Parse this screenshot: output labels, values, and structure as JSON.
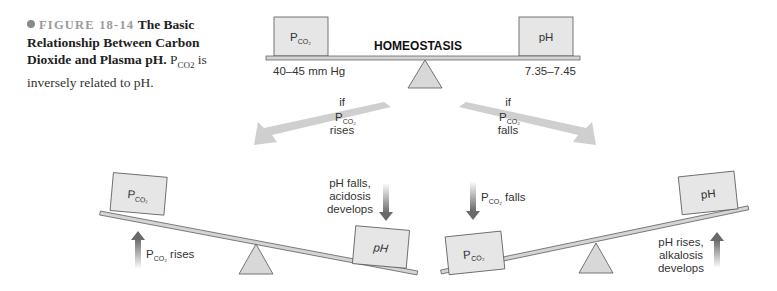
{
  "caption": {
    "figure_label": "FIGURE 18-14",
    "title": "The Basic Relationship Between Carbon Dioxide and Plasma pH.",
    "body_prefix": "P",
    "body_sub": "CO2",
    "body_suffix": " is inversely related to pH."
  },
  "top_scale": {
    "label": "HOMEOSTASIS",
    "left_box": {
      "main": "P",
      "sub": "CO₂"
    },
    "right_box": {
      "main": "pH"
    },
    "left_range": "40–45 mm Hg",
    "right_range": "7.35–7.45"
  },
  "branches": {
    "left": {
      "line1": "if",
      "line2_main": "P",
      "line2_sub": "CO₂",
      "line3": "rises"
    },
    "right": {
      "line1": "if",
      "line2_main": "P",
      "line2_sub": "CO₂",
      "line3": "falls"
    }
  },
  "acidosis_scale": {
    "left_box": {
      "main": "P",
      "sub": "CO₂"
    },
    "right_box": {
      "main": "pH"
    },
    "up_label_main": "P",
    "up_label_sub": "CO₂",
    "up_label_suffix": " rises",
    "down_label": [
      "pH falls,",
      "acidosis",
      "develops"
    ]
  },
  "alkalosis_scale": {
    "left_box": {
      "main": "P",
      "sub": "CO₂"
    },
    "right_box": {
      "main": "pH"
    },
    "down_label_main": "P",
    "down_label_sub": "CO₂",
    "down_label_suffix": " falls",
    "up_label": [
      "pH rises,",
      "alkalosis",
      "develops"
    ]
  },
  "colors": {
    "box_fill": "#e6e6e6",
    "box_stroke": "#555555",
    "beam_fill": "#d4d4d4",
    "arrow_light": "#cfcfcf",
    "arrow_dark": "#6e6e6e",
    "caption_bullet": "#8a8a8a"
  }
}
